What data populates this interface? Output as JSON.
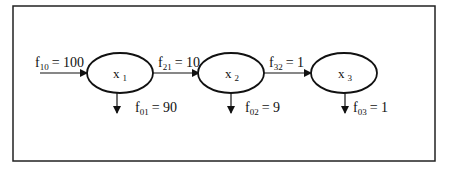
{
  "diagram": {
    "nodes": [
      {
        "id": "x1",
        "label": "x",
        "sub": "1",
        "cx": 120
      },
      {
        "id": "x2",
        "label": "x",
        "sub": "2",
        "cx": 231
      },
      {
        "id": "x3",
        "label": "x",
        "sub": "3",
        "cx": 344
      }
    ],
    "flows": {
      "f10": {
        "name": "f",
        "sub": "10",
        "value": "= 100"
      },
      "f21": {
        "name": "f",
        "sub": "21",
        "value": "= 10"
      },
      "f32": {
        "name": "f",
        "sub": "32",
        "value": "= 1"
      },
      "f01": {
        "name": "f",
        "sub": "01",
        "value": "= 90"
      },
      "f02": {
        "name": "f",
        "sub": "02",
        "value": "= 9"
      },
      "f03": {
        "name": "f",
        "sub": "03",
        "value": "= 1"
      }
    },
    "colors": {
      "stroke": "#111111",
      "background": "#ffffff"
    }
  }
}
